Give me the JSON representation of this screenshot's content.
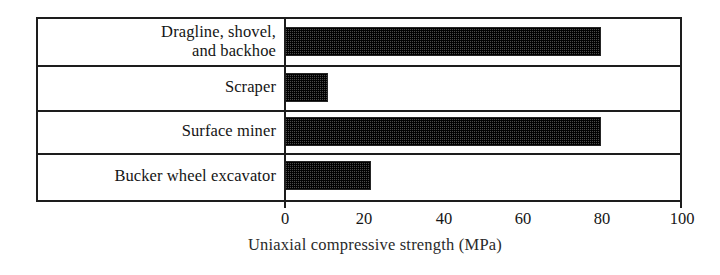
{
  "chart_data": {
    "type": "bar",
    "orientation": "horizontal",
    "title": "",
    "xlabel": "Uniaxial compressive strength (MPa)",
    "ylabel": "",
    "categories": [
      "Dragline, shovel, and backhoe",
      "Scraper",
      "Surface miner",
      "Bucker wheel excavator"
    ],
    "category_lines": [
      [
        "Dragline, shovel,",
        "and backhoe"
      ],
      [
        "Scraper"
      ],
      [
        "Surface miner"
      ],
      [
        "Bucker wheel excavator"
      ]
    ],
    "values": [
      80,
      11,
      80,
      22
    ],
    "xlim": [
      0,
      100
    ],
    "xticks": [
      0,
      20,
      40,
      60,
      80,
      100
    ],
    "xtick_labels": [
      "0",
      "20",
      "40",
      "60",
      "80",
      "100"
    ],
    "grid": false,
    "legend": false,
    "bar_fill": "#3b3b3b",
    "bar_pattern": "checkered-halftone",
    "frame_color": "#1d1d1d",
    "background": "#ffffff"
  },
  "axis": {
    "title": "Uniaxial compressive strength (MPa)",
    "ticks": [
      {
        "label": "0",
        "value": 0
      },
      {
        "label": "20",
        "value": 20
      },
      {
        "label": "40",
        "value": 40
      },
      {
        "label": "60",
        "value": 60
      },
      {
        "label": "80",
        "value": 80
      },
      {
        "label": "100",
        "value": 100
      }
    ]
  },
  "rows": [
    {
      "label_line1": "Dragline, shovel,",
      "label_line2": "and backhoe",
      "value": 80
    },
    {
      "label_line1": "Scraper",
      "label_line2": "",
      "value": 11
    },
    {
      "label_line1": "Surface miner",
      "label_line2": "",
      "value": 80
    },
    {
      "label_line1": "Bucker wheel excavator",
      "label_line2": "",
      "value": 22
    }
  ]
}
